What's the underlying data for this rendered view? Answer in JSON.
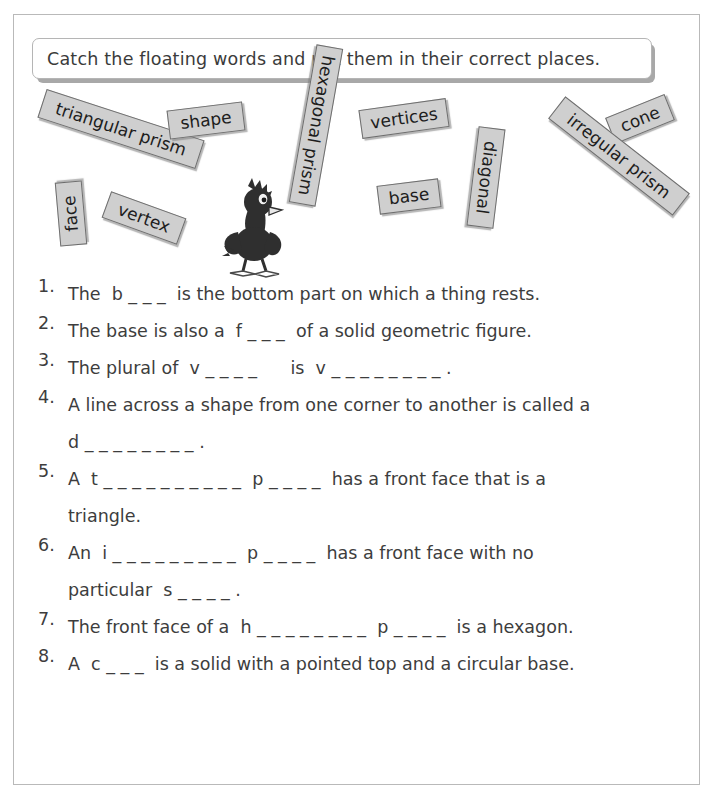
{
  "page": {
    "instruction": "Catch the floating words and put them in their correct places.",
    "border_color": "#b9b9b9",
    "tile_fill_color": "#cfcfcf",
    "tile_border_color": "#6e6e6e",
    "text_color": "#3d3d3d"
  },
  "word_bank": {
    "label": "floating word tiles",
    "tiles": [
      {
        "label": "triangular prism",
        "left": 38,
        "top": 22,
        "width": 166,
        "height": 30,
        "rotate": 18,
        "font_size": 17
      },
      {
        "label": "shape",
        "left": 168,
        "top": 14,
        "width": 76,
        "height": 29,
        "rotate": -7,
        "font_size": 17
      },
      {
        "label": "hexagonal prism",
        "left": 236,
        "top": 20,
        "width": 160,
        "height": 27,
        "rotate": 100,
        "font_size": 17
      },
      {
        "label": "vertices",
        "left": 360,
        "top": 12,
        "width": 88,
        "height": 29,
        "rotate": -8,
        "font_size": 17
      },
      {
        "label": "cone",
        "left": 608,
        "top": 13,
        "width": 64,
        "height": 28,
        "rotate": -22,
        "font_size": 17
      },
      {
        "label": "irregular prism",
        "left": 540,
        "top": 50,
        "width": 158,
        "height": 28,
        "rotate": 38,
        "font_size": 17
      },
      {
        "label": "base",
        "left": 378,
        "top": 90,
        "width": 62,
        "height": 29,
        "rotate": -7,
        "font_size": 17
      },
      {
        "label": "diagonal",
        "left": 436,
        "top": 72,
        "width": 100,
        "height": 27,
        "rotate": 97,
        "font_size": 17
      },
      {
        "label": "face",
        "left": 39,
        "top": 108,
        "width": 64,
        "height": 27,
        "rotate": -95,
        "font_size": 17
      },
      {
        "label": "vertex",
        "left": 104,
        "top": 112,
        "width": 80,
        "height": 28,
        "rotate": 20,
        "font_size": 17
      }
    ]
  },
  "mascot": {
    "name": "cartoon crow",
    "description": "dark cartoon bird with spiky head feathers and three-toed feet"
  },
  "questions": [
    {
      "number": "1.",
      "text": "The  b _ _ _  is the bottom part on which a thing rests.",
      "continuation": ""
    },
    {
      "number": "2.",
      "text": "The base is also a  f _ _ _  of a solid geometric figure.",
      "continuation": ""
    },
    {
      "number": "3.",
      "text": "The plural of  v _ _ _ _      is  v _ _ _ _ _ _ _ _ .",
      "continuation": ""
    },
    {
      "number": "4.",
      "text": "A line across a shape from one corner to another is called a",
      "continuation": "d _ _ _ _ _ _ _ _ ."
    },
    {
      "number": "5.",
      "text": "A  t _ _ _ _ _ _ _ _ _ _  p _ _ _ _  has a front face that is a",
      "continuation": "triangle."
    },
    {
      "number": "6.",
      "text": "An  i _ _ _ _ _ _ _ _ _  p _ _ _ _  has a front face with no",
      "continuation": "particular  s _ _ _ _ ."
    },
    {
      "number": "7.",
      "text": "The front face of a  h _ _ _ _ _ _ _ _  p _ _ _ _  is a hexagon.",
      "continuation": ""
    },
    {
      "number": "8.",
      "text": "A  c _ _ _  is a solid with a pointed top and a circular base.",
      "continuation": ""
    }
  ]
}
